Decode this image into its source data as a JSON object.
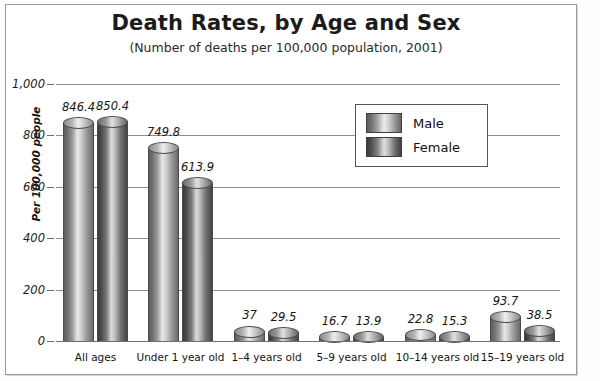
{
  "chart_data": {
    "type": "bar",
    "title": "Death Rates, by Age and Sex",
    "subtitle": "(Number of deaths per 100,000 population, 2001)",
    "xlabel": "",
    "ylabel": "Per 100,000 people",
    "ylim": [
      0,
      1000
    ],
    "ytick_labels": [
      "1,000",
      "800",
      "600",
      "400",
      "200",
      "0"
    ],
    "ytick_values": [
      1000,
      800,
      600,
      400,
      200,
      0
    ],
    "grid": true,
    "legend_position": "upper-right-inside",
    "categories": [
      "All ages",
      "Under 1 year old",
      "1–4 years old",
      "5–9 years old",
      "10–14 years old",
      "15–19 years old"
    ],
    "series": [
      {
        "name": "Male",
        "color": "#a8a8a8",
        "values": [
          846.4,
          749.8,
          37,
          16.7,
          22.8,
          93.7
        ],
        "labels": [
          "846.4",
          "749.8",
          "37",
          "16.7",
          "22.8",
          "93.7"
        ]
      },
      {
        "name": "Female",
        "color": "#707070",
        "values": [
          850.4,
          613.9,
          29.5,
          13.9,
          15.3,
          38.5
        ],
        "labels": [
          "850.4",
          "613.9",
          "29.5",
          "13.9",
          "15.3",
          "38.5"
        ]
      }
    ]
  },
  "legend": {
    "items": [
      {
        "label": "Male"
      },
      {
        "label": "Female"
      }
    ]
  }
}
